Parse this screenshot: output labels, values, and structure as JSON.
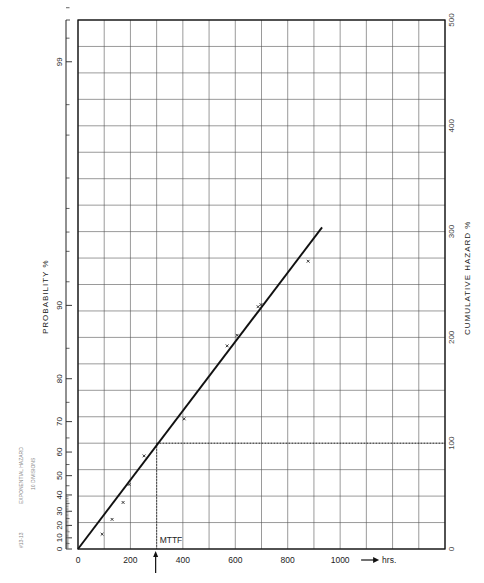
{
  "paper": {
    "side_note_line1": "EXPONENTIAL HAZARD",
    "side_note_line2": "10 DIVISIONS",
    "catalog_no": "#13-13",
    "marker": "x"
  },
  "chart_data": {
    "type": "scatter",
    "title": "",
    "subtitle": "Exponential hazard plot",
    "xlabel": "hrs.",
    "ylabel_left": "PROBABILITY %",
    "ylabel_right": "CUMULATIVE HAZARD %",
    "x_range": [
      0,
      1400
    ],
    "x_ticks": [
      0,
      200,
      400,
      600,
      800,
      1000
    ],
    "x_tick_labels": [
      "0",
      "200",
      "400",
      "600",
      "800",
      "1000"
    ],
    "x_grid_step": 100,
    "hazard_range": [
      0,
      500
    ],
    "hazard_ticks": [
      0,
      100,
      200,
      300,
      400,
      500
    ],
    "hazard_grid_step": 25,
    "probability_ticks": [
      0,
      10,
      20,
      30,
      40,
      50,
      60,
      70,
      80,
      90,
      99
    ],
    "probability_minor_ticks": [
      5,
      15,
      25,
      35,
      45,
      55,
      65,
      75,
      85,
      92,
      94,
      95,
      96,
      97,
      98,
      98.5,
      99.2,
      99.4
    ],
    "grid": true,
    "legend": null,
    "series": [
      {
        "name": "Observed failures",
        "marker": "x",
        "x": [
          92,
          130,
          172,
          195,
          252,
          405,
          569,
          607,
          687,
          698,
          878
        ],
        "hazard": [
          14,
          28,
          44,
          61,
          88,
          123,
          192,
          202,
          229,
          231,
          272
        ]
      },
      {
        "name": "Fitted line",
        "type": "line",
        "x": [
          0,
          931
        ],
        "hazard": [
          0,
          304
        ]
      }
    ],
    "annotations": [
      {
        "text": "MTTF",
        "x": 300,
        "hazard": 100,
        "note": "dotted line from 100% cumulative hazard to MTTF ≈ 300 hrs, with arrow"
      },
      {
        "text": "→ hrs.",
        "note": "x-axis unit"
      }
    ]
  }
}
